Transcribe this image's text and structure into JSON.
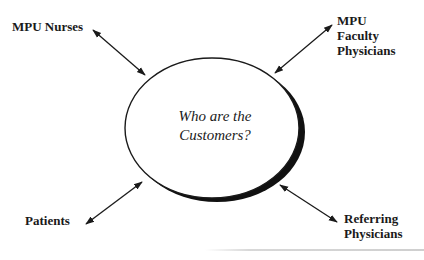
{
  "diagram": {
    "center": {
      "line1": "Who are the",
      "line2": "Customers?"
    },
    "nodes": [
      {
        "id": "mpu-nurses",
        "lines": [
          "MPU Nurses"
        ]
      },
      {
        "id": "mpu-faculty-physicians",
        "lines": [
          "MPU",
          "Faculty",
          "Physicians"
        ]
      },
      {
        "id": "patients",
        "lines": [
          "Patients"
        ]
      },
      {
        "id": "referring-physicians",
        "lines": [
          "Referring",
          "Physicians"
        ]
      }
    ],
    "edges": [
      {
        "from": "center",
        "to": "mpu-nurses",
        "type": "bidirectional-arrow"
      },
      {
        "from": "center",
        "to": "mpu-faculty-physicians",
        "type": "bidirectional-arrow"
      },
      {
        "from": "center",
        "to": "patients",
        "type": "bidirectional-arrow"
      },
      {
        "from": "center",
        "to": "referring-physicians",
        "type": "bidirectional-arrow"
      }
    ],
    "colors": {
      "ink": "#1a1a1a",
      "background": "#ffffff",
      "rule": "#d0d0d0"
    }
  }
}
